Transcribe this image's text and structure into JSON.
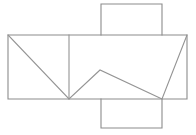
{
  "figure": {
    "background_color": "#ffffff",
    "line_color": "#8c8c8c",
    "fold_line_color": "#949494",
    "stroke_width": 1.1,
    "canvas": {
      "width": 196,
      "height": 135
    }
  },
  "geometry": {
    "band": {
      "name": "main-band-rectangle",
      "left": 8,
      "right": 187,
      "top": 35,
      "bottom": 99,
      "width": 179,
      "height": 64
    },
    "top_flap": {
      "name": "top-square-flap",
      "left": 101,
      "right": 162,
      "top": 4,
      "bottom": 35,
      "width": 61,
      "height": 31
    },
    "bottom_flap": {
      "name": "bottom-square-flap",
      "left": 101,
      "right": 162,
      "top": 99,
      "bottom": 128,
      "width": 61,
      "height": 29
    },
    "vertical_divider": {
      "name": "vertical-fold-line",
      "x": 69,
      "y1": 35,
      "y2": 99
    },
    "vertices": {
      "band_top_left": [
        8,
        35
      ],
      "band_top_right": [
        187,
        35
      ],
      "band_bottom_left": [
        8,
        99
      ],
      "band_bottom_right": [
        187,
        99
      ],
      "divider_top": [
        69,
        35
      ],
      "divider_bottom": [
        69,
        99
      ],
      "peak_apex": [
        100,
        70
      ],
      "right_valley": [
        162,
        99
      ],
      "flap_top_left": [
        101,
        4
      ],
      "flap_top_right": [
        162,
        4
      ],
      "flap_bottom_left": [
        101,
        128
      ],
      "flap_bottom_right": [
        162,
        128
      ]
    },
    "diagonals": [
      {
        "name": "diagonal-left-descending",
        "from": [
          8,
          35
        ],
        "to": [
          69,
          99
        ]
      },
      {
        "name": "diagonal-mid-ascending",
        "from": [
          69,
          99
        ],
        "to": [
          100,
          70
        ]
      },
      {
        "name": "diagonal-mid-descending",
        "from": [
          100,
          70
        ],
        "to": [
          162,
          99
        ]
      },
      {
        "name": "diagonal-right-ascending",
        "from": [
          162,
          99
        ],
        "to": [
          187,
          35
        ]
      }
    ]
  },
  "paths": {
    "band_outline": "M 8 35 L 187 35 L 187 99 L 8 99 Z",
    "top_flap_outline": "M 101 35 L 101 4 L 162 4 L 162 35",
    "bottom_flap_outline": "M 101 99 L 101 128 L 162 128 L 162 99",
    "vertical_divider": "M 69 35 L 69 99",
    "zigzag": "M 8 35 L 69 99 L 100 70 L 162 99 L 187 35",
    "top_flap_side_left": "M 101 4 L 101 35",
    "top_flap_side_right": "M 162 4 L 162 35",
    "bottom_flap_side_left": "M 101 99 L 101 128",
    "bottom_flap_side_right": "M 162 99 L 162 128"
  }
}
